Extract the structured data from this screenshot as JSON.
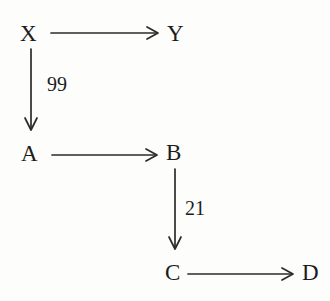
{
  "diagram": {
    "type": "directed-graph",
    "background_color": "#fdfdfc",
    "stroke_color": "#2b2b2b",
    "text_color": "#1c1c1c",
    "nodes": [
      {
        "id": "X",
        "label": "X",
        "x": 20,
        "y": 22
      },
      {
        "id": "Y",
        "label": "Y",
        "x": 167,
        "y": 22
      },
      {
        "id": "A",
        "label": "A",
        "x": 21,
        "y": 142
      },
      {
        "id": "B",
        "label": "B",
        "x": 166,
        "y": 141
      },
      {
        "id": "C",
        "label": "C",
        "x": 165,
        "y": 261
      },
      {
        "id": "D",
        "label": "D",
        "x": 302,
        "y": 261
      }
    ],
    "edges": [
      {
        "from": "X",
        "to": "Y",
        "label": "",
        "orientation": "horizontal"
      },
      {
        "from": "X",
        "to": "A",
        "label": "99",
        "orientation": "vertical"
      },
      {
        "from": "A",
        "to": "B",
        "label": "",
        "orientation": "horizontal"
      },
      {
        "from": "B",
        "to": "C",
        "label": "21",
        "orientation": "vertical"
      },
      {
        "from": "C",
        "to": "D",
        "label": "",
        "orientation": "horizontal"
      }
    ],
    "edge_labels": [
      {
        "id": "xa-weight",
        "text": "99",
        "x": 47,
        "y": 74
      },
      {
        "id": "bc-weight",
        "text": "21",
        "x": 185,
        "y": 198
      }
    ]
  }
}
